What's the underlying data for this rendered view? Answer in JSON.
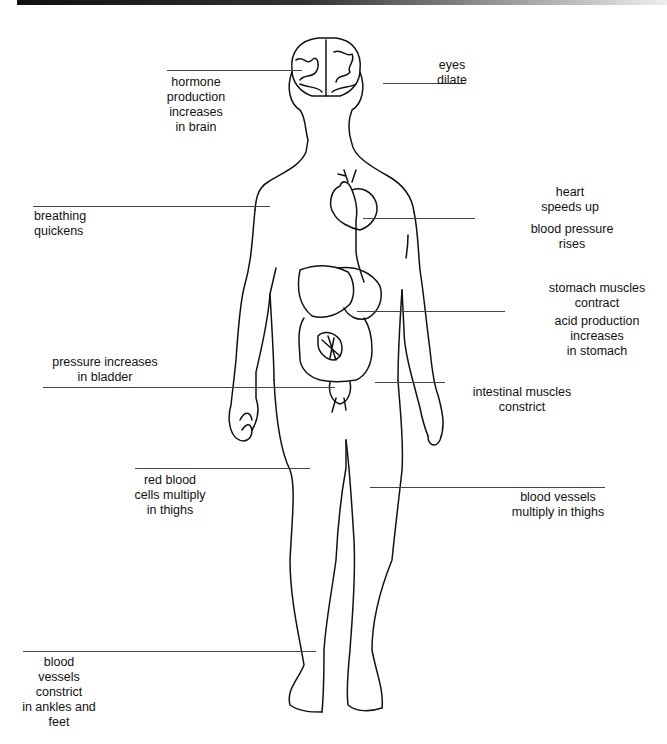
{
  "diagram": {
    "title": "",
    "labels": {
      "hormone": "hormone\nproduction\nincreases\nin brain",
      "eyes": "eyes\ndilate",
      "breathing": "breathing\nquickens",
      "heart": "heart\nspeeds up",
      "blood_pressure": "blood pressure\nrises",
      "stomach_muscles": "stomach muscles\ncontract",
      "acid": "acid production\nincreases\nin stomach",
      "bladder": "pressure increases\nin bladder",
      "intestinal": "intestinal muscles\nconstrict",
      "red_blood": "red blood\ncells multiply\nin thighs",
      "vessels_thighs": "blood vessels\nmultiply in thighs",
      "vessels_ankles": "blood\nvessels\nconstrict\nin ankles and\nfeet"
    },
    "colors": {
      "line": "#444444",
      "outline": "#111111",
      "background": "#ffffff"
    }
  }
}
